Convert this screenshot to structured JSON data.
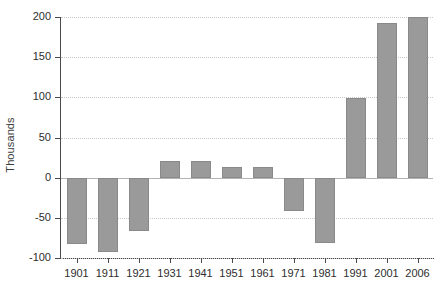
{
  "chart_data": {
    "type": "bar",
    "title": "",
    "xlabel": "",
    "ylabel": "Thousands",
    "categories": [
      "1901",
      "1911",
      "1921",
      "1931",
      "1941",
      "1951",
      "1961",
      "1971",
      "1981",
      "1991",
      "2001",
      "2006"
    ],
    "values": [
      -83,
      -92,
      -67,
      21,
      21,
      13,
      13,
      -41,
      -81,
      99,
      193,
      200
    ],
    "ylim": [
      -100,
      200
    ],
    "yticks": [
      200,
      150,
      100,
      50,
      0,
      -50,
      -100
    ],
    "ytick_labels": [
      "200",
      "150",
      "100",
      "50",
      "0",
      "-50",
      "-100"
    ],
    "grid": true,
    "legend": false,
    "legend_position": "none",
    "bar_color": "#9a9a9a",
    "axis_color": "#4a4a4a",
    "grid_color": "#c9c9c9",
    "zero_line_color": "#b4b4b4"
  }
}
